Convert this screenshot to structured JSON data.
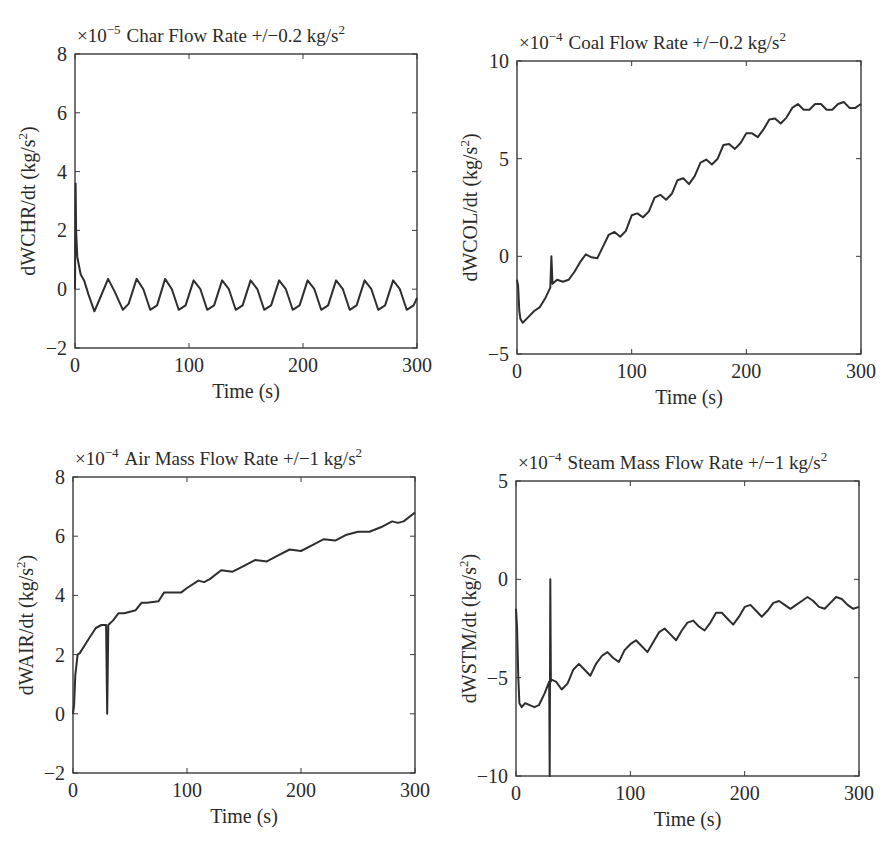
{
  "chart_data": [
    {
      "type": "line",
      "title": "Char Flow Rate +/−0.2 kg/s²",
      "scale": "×10⁻⁵",
      "xlabel": "Time (s)",
      "ylabel": "dWCHR/dt (kg/s²)",
      "xlim": [
        0,
        300
      ],
      "ylim": [
        -2,
        8
      ],
      "xticks": [
        0,
        100,
        200,
        300
      ],
      "yticks": [
        -2,
        0,
        2,
        4,
        6,
        8
      ],
      "grid": false,
      "series": [
        {
          "name": "dWCHR/dt",
          "description": "initial spike to ~3.6 at t=0, then sinusoidal oscillation between ~-0.7 and ~0.3 with period ~25 s",
          "x": [
            0,
            0.5,
            1,
            2,
            3,
            5,
            8,
            12,
            17,
            22,
            29,
            35,
            42,
            47,
            54,
            60,
            66,
            72,
            79,
            85,
            91,
            97,
            104,
            110,
            116,
            122,
            129,
            135,
            141,
            147,
            154,
            160,
            166,
            172,
            179,
            185,
            191,
            197,
            204,
            210,
            216,
            222,
            229,
            235,
            241,
            247,
            254,
            260,
            266,
            272,
            279,
            285,
            291,
            297,
            300
          ],
          "y": [
            0,
            3.6,
            2.0,
            1.1,
            0.9,
            0.5,
            0.3,
            -0.2,
            -0.75,
            -0.3,
            0.35,
            -0.1,
            -0.7,
            -0.5,
            0.35,
            0.0,
            -0.7,
            -0.55,
            0.35,
            0.0,
            -0.7,
            -0.55,
            0.3,
            0.0,
            -0.7,
            -0.55,
            0.3,
            0.0,
            -0.7,
            -0.55,
            0.3,
            0.0,
            -0.7,
            -0.55,
            0.3,
            0.0,
            -0.7,
            -0.55,
            0.3,
            0.0,
            -0.7,
            -0.55,
            0.3,
            0.0,
            -0.7,
            -0.55,
            0.3,
            0.0,
            -0.7,
            -0.55,
            0.3,
            0.0,
            -0.7,
            -0.55,
            -0.3
          ]
        }
      ]
    },
    {
      "type": "line",
      "title": "Coal Flow Rate +/−0.2 kg/s²",
      "scale": "×10⁻⁴",
      "xlabel": "Time (s)",
      "ylabel": "dWCOL/dt (kg/s²)",
      "xlim": [
        0,
        300
      ],
      "ylim": [
        -5,
        10
      ],
      "xticks": [
        0,
        100,
        200,
        300
      ],
      "yticks": [
        -5,
        0,
        5,
        10
      ],
      "grid": false,
      "series": [
        {
          "name": "dWCOL/dt",
          "x": [
            0,
            1,
            2,
            3,
            5,
            10,
            15,
            20,
            25,
            29,
            30,
            31,
            35,
            40,
            45,
            50,
            55,
            60,
            65,
            70,
            75,
            80,
            85,
            90,
            95,
            100,
            105,
            110,
            115,
            120,
            125,
            130,
            135,
            140,
            145,
            150,
            155,
            160,
            165,
            170,
            175,
            180,
            185,
            190,
            195,
            200,
            205,
            210,
            215,
            220,
            225,
            230,
            235,
            240,
            245,
            250,
            255,
            260,
            265,
            270,
            275,
            280,
            285,
            290,
            295,
            300
          ],
          "y": [
            -1.2,
            -1.5,
            -2.8,
            -3.2,
            -3.4,
            -3.1,
            -2.8,
            -2.6,
            -2.1,
            -1.6,
            0.0,
            -1.4,
            -1.2,
            -1.3,
            -1.2,
            -0.8,
            -0.3,
            0.1,
            -0.05,
            -0.1,
            0.5,
            1.1,
            1.25,
            1.0,
            1.3,
            2.1,
            2.2,
            2.0,
            2.3,
            3.0,
            3.15,
            2.9,
            3.2,
            3.9,
            4.0,
            3.7,
            4.1,
            4.8,
            4.95,
            4.7,
            5.0,
            5.7,
            5.75,
            5.5,
            5.8,
            6.3,
            6.3,
            6.1,
            6.5,
            7.0,
            7.05,
            6.8,
            7.1,
            7.6,
            7.8,
            7.5,
            7.5,
            7.8,
            7.8,
            7.5,
            7.5,
            7.8,
            7.9,
            7.6,
            7.6,
            7.8
          ]
        }
      ]
    },
    {
      "type": "line",
      "title": "Air Mass Flow Rate +/−1 kg/s²",
      "scale": "×10⁻⁴",
      "xlabel": "Time (s)",
      "ylabel": "dWAIR/dt (kg/s²)",
      "xlim": [
        0,
        300
      ],
      "ylim": [
        -2,
        8
      ],
      "xticks": [
        0,
        100,
        200,
        300
      ],
      "yticks": [
        -2,
        0,
        2,
        4,
        6,
        8
      ],
      "grid": false,
      "series": [
        {
          "name": "dWAIR/dt",
          "description": "starts at ~0, rises to 2 at t~5, 3 at t~20, spike down to 0 at t~30, then staircase-like steady climb to ~6.8 at t=300",
          "x": [
            0,
            1,
            2,
            4,
            6,
            10,
            15,
            20,
            25,
            29,
            30,
            31,
            35,
            40,
            45,
            55,
            60,
            65,
            75,
            80,
            90,
            95,
            100,
            110,
            115,
            120,
            130,
            140,
            150,
            160,
            170,
            180,
            190,
            200,
            210,
            220,
            230,
            240,
            250,
            260,
            270,
            280,
            285,
            290,
            300
          ],
          "y": [
            0,
            0.3,
            1.3,
            2.0,
            2.05,
            2.3,
            2.6,
            2.9,
            3.0,
            3.0,
            0.0,
            3.0,
            3.15,
            3.4,
            3.4,
            3.5,
            3.75,
            3.75,
            3.8,
            4.1,
            4.1,
            4.1,
            4.25,
            4.5,
            4.45,
            4.55,
            4.85,
            4.8,
            5.0,
            5.2,
            5.15,
            5.35,
            5.55,
            5.5,
            5.7,
            5.9,
            5.85,
            6.05,
            6.15,
            6.15,
            6.3,
            6.5,
            6.45,
            6.5,
            6.8
          ]
        }
      ]
    },
    {
      "type": "line",
      "title": "Steam Mass Flow Rate +/−1 kg/s²",
      "scale": "×10⁻⁴",
      "xlabel": "Time (s)",
      "ylabel": "dWSTM/dt (kg/s²)",
      "xlim": [
        0,
        300
      ],
      "ylim": [
        -10,
        5
      ],
      "xticks": [
        0,
        100,
        200,
        300
      ],
      "yticks": [
        -10,
        -5,
        0,
        5
      ],
      "grid": false,
      "series": [
        {
          "name": "dWSTM/dt",
          "description": "initial spike at t=0, drops to ~-6.5, flat until t~25, spike from -10 to 0 at t~30, then oscillating rise to ~-1.5 at t=300",
          "x": [
            0,
            1,
            2,
            3,
            5,
            8,
            12,
            16,
            20,
            25,
            29,
            29.5,
            30,
            30.5,
            31,
            35,
            40,
            45,
            50,
            55,
            60,
            65,
            70,
            75,
            80,
            85,
            90,
            95,
            100,
            105,
            110,
            115,
            120,
            125,
            130,
            135,
            140,
            145,
            150,
            155,
            160,
            165,
            170,
            175,
            180,
            185,
            190,
            195,
            200,
            205,
            210,
            215,
            220,
            225,
            230,
            235,
            240,
            245,
            250,
            255,
            260,
            265,
            270,
            275,
            280,
            285,
            290,
            295,
            300
          ],
          "y": [
            -1.5,
            -2.5,
            -5.0,
            -6.3,
            -6.5,
            -6.3,
            -6.4,
            -6.5,
            -6.4,
            -5.8,
            -5.2,
            -10,
            0,
            -5.2,
            -5.1,
            -5.2,
            -5.6,
            -5.3,
            -4.6,
            -4.3,
            -4.6,
            -4.9,
            -4.3,
            -3.9,
            -3.7,
            -4.0,
            -4.2,
            -3.6,
            -3.3,
            -3.1,
            -3.4,
            -3.7,
            -3.2,
            -2.7,
            -2.5,
            -2.8,
            -3.1,
            -2.6,
            -2.2,
            -2.1,
            -2.4,
            -2.6,
            -2.2,
            -1.7,
            -1.7,
            -2.0,
            -2.3,
            -1.9,
            -1.4,
            -1.3,
            -1.6,
            -1.9,
            -1.6,
            -1.2,
            -1.1,
            -1.3,
            -1.5,
            -1.3,
            -1.1,
            -0.9,
            -1.1,
            -1.4,
            -1.5,
            -1.2,
            -0.9,
            -1.0,
            -1.3,
            -1.5,
            -1.4
          ]
        }
      ]
    }
  ]
}
